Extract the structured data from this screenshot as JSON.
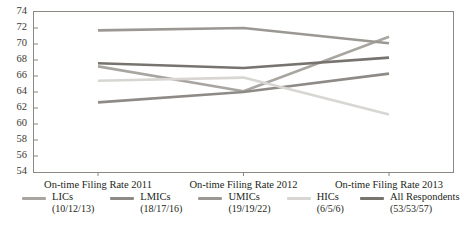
{
  "title_fragment": "",
  "chart_data": {
    "type": "line",
    "title": "",
    "subtitle": "",
    "xlabel": "",
    "ylabel": "",
    "categories": [
      "On-time Filing Rate 2011",
      "On-time Filing Rate 2012",
      "On-time Filing Rate 2013"
    ],
    "ylim": [
      54,
      74
    ],
    "ytick_step": 2,
    "yticks": [
      54,
      56,
      58,
      60,
      62,
      64,
      66,
      68,
      70,
      72,
      74
    ],
    "grid": false,
    "legend_position": "bottom",
    "series": [
      {
        "name": "LICs",
        "sublabel": "(10/12/13)",
        "color": "#a9a6a1",
        "values": [
          67.2,
          64.1,
          70.9
        ]
      },
      {
        "name": "LMICs",
        "sublabel": "(18/17/16)",
        "color": "#8e8b86",
        "values": [
          62.7,
          64.0,
          66.3
        ]
      },
      {
        "name": "UMICs",
        "sublabel": "(19/19/22)",
        "color": "#9b9893",
        "values": [
          71.7,
          72.0,
          70.1
        ]
      },
      {
        "name": "HICs",
        "sublabel": "(6/5/6)",
        "color": "#d8d6d2",
        "values": [
          65.4,
          65.8,
          61.2
        ]
      },
      {
        "name": "All Respondents",
        "sublabel": "(53/53/57)",
        "color": "#77746f",
        "values": [
          67.6,
          67.0,
          68.3
        ]
      }
    ]
  },
  "axis": {
    "y_values": [
      "74",
      "72",
      "70",
      "68",
      "66",
      "64",
      "62",
      "60",
      "58",
      "56",
      "54"
    ],
    "x_values": [
      "On-time Filing Rate 2011",
      "On-time Filing Rate 2012",
      "On-time Filing Rate 2013"
    ]
  },
  "legend": {
    "items": [
      {
        "label": "LICs",
        "sub": "(10/12/13)",
        "color": "#a9a6a1"
      },
      {
        "label": "LMICs",
        "sub": "(18/17/16)",
        "color": "#8e8b86"
      },
      {
        "label": "UMICs",
        "sub": "(19/19/22)",
        "color": "#9b9893"
      },
      {
        "label": "HICs",
        "sub": "(6/5/6)",
        "color": "#d8d6d2"
      },
      {
        "label": "All Respondents",
        "sub": "(53/53/57)",
        "color": "#77746f"
      }
    ]
  },
  "colors": {
    "axis": "#7a7772",
    "text": "#231f20"
  }
}
